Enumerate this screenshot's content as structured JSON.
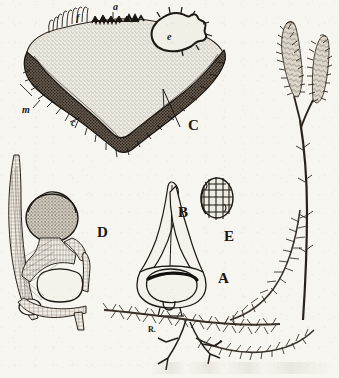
{
  "plate": {
    "title": "Lycopodium botanical plate",
    "width": 339,
    "height": 378,
    "background_color": "#f7f5f0",
    "ink_color": "#1a1713",
    "medium": "engraving"
  },
  "figures": [
    {
      "key": "A",
      "label": "A",
      "name": "habit-of-plant",
      "description": "Trailing clubmoss shoot with ascending forked strobili",
      "label_x": 218,
      "label_y": 271
    },
    {
      "key": "B",
      "label": "B",
      "name": "sporophyll-with-sporangium",
      "description": "Sporophyll bearing reniform sporangium at its base",
      "label_x": 178,
      "label_y": 205
    },
    {
      "key": "C",
      "label": "C",
      "name": "prothallus-section",
      "description": "Vertical section of the prothallus",
      "label_x": 188,
      "label_y": 118
    },
    {
      "key": "D",
      "label": "D",
      "name": "sporangium-in-leaf-axil",
      "description": "Sporangium seated in the axil of a leaf",
      "label_x": 97,
      "label_y": 225
    },
    {
      "key": "E",
      "label": "E",
      "name": "spore",
      "description": "Single reticulate spore",
      "label_x": 224,
      "label_y": 229
    }
  ],
  "detail_labels": [
    {
      "label": "a",
      "name": "apical-growing-region",
      "figure": "C",
      "x": 113,
      "y": 2
    },
    {
      "label": "f",
      "name": "filamentous-outgrowths",
      "figure": "C",
      "x": 76,
      "y": 13
    },
    {
      "label": "e",
      "name": "embryo",
      "figure": "C",
      "x": 167,
      "y": 32
    },
    {
      "label": "m",
      "name": "mycorrhizal-tissue",
      "figure": "C",
      "x": 22,
      "y": 105
    },
    {
      "label": "c",
      "name": "rhizoid-bearing-cortex",
      "figure": "C",
      "x": 71,
      "y": 118
    },
    {
      "label": "R.",
      "name": "root-system",
      "figure": "A",
      "x": 148,
      "y": 326
    }
  ]
}
